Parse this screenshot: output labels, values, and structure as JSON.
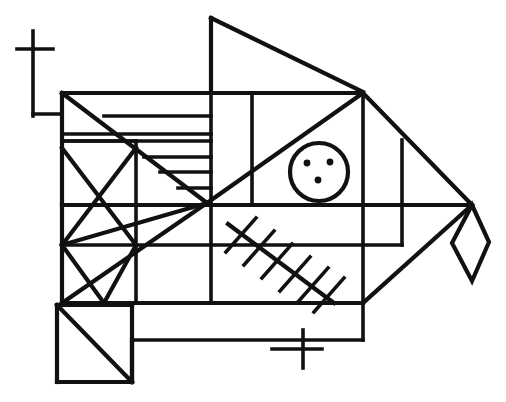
{
  "figure": {
    "title": "Abstract geometric fish line drawing",
    "canvas": {
      "width": 506,
      "height": 402
    },
    "background_color": "#ffffff",
    "ink_color": "#111111",
    "parts": [
      {
        "name": "upper-left-cross-mark",
        "label": "cross mark upper left"
      },
      {
        "name": "left-lead-line",
        "label": "horizontal lead line"
      },
      {
        "name": "dorsal-fin-triangle",
        "label": "top triangular dorsal fin"
      },
      {
        "name": "body-outline",
        "label": "main body outline"
      },
      {
        "name": "stripe-band",
        "label": "horizontal stripe band"
      },
      {
        "name": "x-crossed-box",
        "label": "box with X diagonals"
      },
      {
        "name": "eye-circle",
        "label": "circle with three dots"
      },
      {
        "name": "herringbone-hatch",
        "label": "hatched diagonal rib line"
      },
      {
        "name": "tail-diamond",
        "label": "diamond tail fin"
      },
      {
        "name": "lower-left-box",
        "label": "lower left box with diagonal"
      },
      {
        "name": "lower-cross-mark",
        "label": "cross mark lower center"
      }
    ]
  }
}
